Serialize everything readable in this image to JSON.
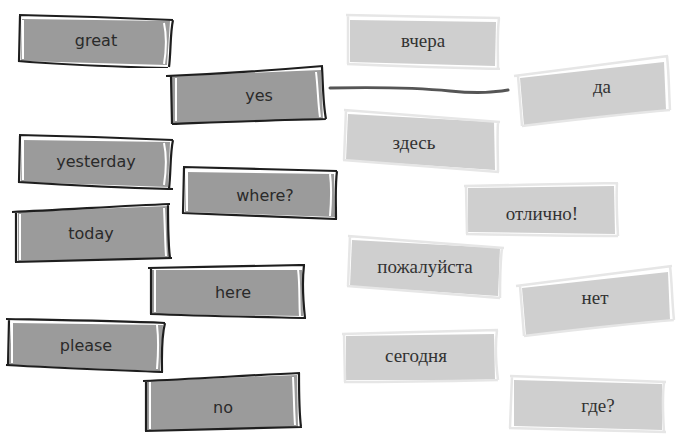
{
  "exercise": {
    "english_cards": [
      {
        "id": "great",
        "label": "great"
      },
      {
        "id": "yes",
        "label": "yes"
      },
      {
        "id": "yesterday",
        "label": "yesterday"
      },
      {
        "id": "where",
        "label": "where?"
      },
      {
        "id": "today",
        "label": "today"
      },
      {
        "id": "here",
        "label": "here"
      },
      {
        "id": "please",
        "label": "please"
      },
      {
        "id": "no",
        "label": "no"
      }
    ],
    "russian_cards": [
      {
        "id": "vchera",
        "label": "вчера"
      },
      {
        "id": "da",
        "label": "да"
      },
      {
        "id": "zdes",
        "label": "здесь"
      },
      {
        "id": "otlichno",
        "label": "отлично!"
      },
      {
        "id": "pozhaluysta",
        "label": "пожалуйста"
      },
      {
        "id": "net",
        "label": "нет"
      },
      {
        "id": "segodnya",
        "label": "сегодня"
      },
      {
        "id": "gde",
        "label": "где?"
      }
    ],
    "connections": [
      {
        "from": "yes",
        "to": "да"
      }
    ]
  },
  "colors": {
    "english_fill": "#9b9b9b",
    "english_border": "#1e1e1e",
    "russian_fill": "#cfcfcf",
    "russian_border": "#e6e6e6",
    "link_line": "#555555",
    "background": "#ffffff"
  }
}
